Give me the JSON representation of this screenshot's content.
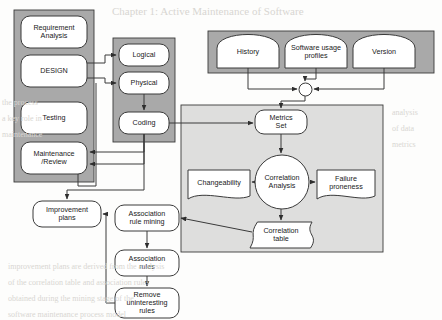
{
  "diagram": {
    "colors": {
      "panel_dark": "#a9a9a9",
      "panel_light": "#dededd",
      "node_fill": "#ffffff",
      "stroke": "#3a3a3a",
      "ghost": "#d8d6d2"
    },
    "panels": [
      {
        "name": "lifecycle-panel",
        "x": 14,
        "y": 10,
        "w": 80,
        "h": 172,
        "fill": "#a9a9a9"
      },
      {
        "name": "design-stage-panel",
        "x": 113,
        "y": 38,
        "w": 62,
        "h": 104,
        "fill": "#a9a9a9"
      },
      {
        "name": "data-sources-panel",
        "x": 208,
        "y": 31,
        "w": 226,
        "h": 42,
        "fill": "#a9a9a9"
      },
      {
        "name": "analysis-panel",
        "x": 181,
        "y": 105,
        "w": 202,
        "h": 147,
        "fill": "#dededd"
      }
    ],
    "nodes": [
      {
        "name": "requirement-analysis",
        "label": "Requirement\nAnalysis",
        "shape": "rounded",
        "x": 21,
        "y": 16,
        "w": 66,
        "h": 32,
        "font": 7.2
      },
      {
        "name": "design",
        "label": "DESIGN",
        "shape": "rounded",
        "x": 21,
        "y": 55,
        "w": 66,
        "h": 32,
        "font": 7.2
      },
      {
        "name": "testing",
        "label": "Testing",
        "shape": "rounded",
        "x": 21,
        "y": 102,
        "w": 66,
        "h": 32,
        "font": 7.2
      },
      {
        "name": "maintenance-review",
        "label": "Maintenance\n/Review",
        "shape": "rounded",
        "x": 21,
        "y": 142,
        "w": 66,
        "h": 32,
        "font": 7.2
      },
      {
        "name": "logical",
        "label": "Logical",
        "shape": "rounded",
        "x": 119,
        "y": 44,
        "w": 50,
        "h": 22,
        "font": 7.2
      },
      {
        "name": "physical",
        "label": "Physical",
        "shape": "rounded",
        "x": 119,
        "y": 72,
        "w": 50,
        "h": 22,
        "font": 7.2
      },
      {
        "name": "coding",
        "label": "Coding",
        "shape": "rounded",
        "x": 119,
        "y": 112,
        "w": 50,
        "h": 22,
        "font": 7.2
      },
      {
        "name": "history",
        "label": "History",
        "shape": "cylinder-top",
        "x": 217,
        "y": 36,
        "w": 62,
        "h": 32,
        "font": 7.2
      },
      {
        "name": "software-usage-profiles",
        "label": "Software usage\nprofiles",
        "shape": "cylinder-top",
        "x": 285,
        "y": 36,
        "w": 62,
        "h": 32,
        "font": 7.2
      },
      {
        "name": "version",
        "label": "Version",
        "shape": "cylinder-top",
        "x": 353,
        "y": 36,
        "w": 62,
        "h": 32,
        "font": 7.2
      },
      {
        "name": "junction",
        "label": "",
        "shape": "circle-junction",
        "x": 299,
        "y": 83,
        "w": 13,
        "h": 13,
        "font": 0
      },
      {
        "name": "metrics-set",
        "label": "Metrics\nSet",
        "shape": "rounded",
        "x": 255,
        "y": 110,
        "w": 52,
        "h": 24,
        "font": 7.2
      },
      {
        "name": "correlation-analysis",
        "label": "Correlation\nAnalysis",
        "shape": "circle",
        "x": 255,
        "y": 155,
        "w": 54,
        "h": 54,
        "font": 7.2
      },
      {
        "name": "changeability",
        "label": "Changeability",
        "shape": "document",
        "x": 188,
        "y": 170,
        "w": 62,
        "h": 26,
        "font": 7.2
      },
      {
        "name": "failure-proneness",
        "label": "Failure\nproneness",
        "shape": "document",
        "x": 317,
        "y": 170,
        "w": 58,
        "h": 26,
        "font": 7.2
      },
      {
        "name": "correlation-table",
        "label": "Correlation\ntable",
        "shape": "data-tape",
        "x": 250,
        "y": 222,
        "w": 62,
        "h": 26,
        "font": 7.2
      },
      {
        "name": "improvement-plans",
        "label": "Improvement\nplans",
        "shape": "rounded",
        "x": 33,
        "y": 201,
        "w": 68,
        "h": 26,
        "font": 7.2
      },
      {
        "name": "association-rule-mining",
        "label": "Association\nrule mining",
        "shape": "rounded",
        "x": 115,
        "y": 205,
        "w": 64,
        "h": 26,
        "font": 7.2
      },
      {
        "name": "association-rules",
        "label": "Association\nrules",
        "shape": "rounded",
        "x": 115,
        "y": 250,
        "w": 64,
        "h": 26,
        "font": 7.2
      },
      {
        "name": "remove-uninteresting-rules",
        "label": "Remove\nuninteresting\nrules",
        "shape": "rounded",
        "x": 115,
        "y": 288,
        "w": 64,
        "h": 30,
        "font": 7.2
      }
    ],
    "connectors": [
      {
        "name": "design-to-logical",
        "d": "M 87 63 L 105 63 L 105 55 L 116 55",
        "arrow": "end"
      },
      {
        "name": "design-to-physical",
        "d": "M 87 78 L 105 78 L 105 83 L 116 83",
        "arrow": "end"
      },
      {
        "name": "physical-to-coding",
        "d": "M 144 94 L 144 110",
        "arrow": "end"
      },
      {
        "name": "coding-to-maintenance-up",
        "d": "M 144 134 L 144 152 L 90 152",
        "arrow": "end"
      },
      {
        "name": "coding-loop-to-maintenance",
        "d": "M 144 134 L 144 164 L 90 164",
        "arrow": "end"
      },
      {
        "name": "maintenance-to-physical-left",
        "d": "M 78 160 L 78 186 L 96 186 L 96 83",
        "arrow": "none"
      },
      {
        "name": "coding-to-metrics",
        "d": "M 169 123 L 253 123",
        "arrow": "end"
      },
      {
        "name": "coding-down-to-improvement",
        "d": "M 144 134 L 144 190 L 67 190 L 67 199",
        "arrow": "end"
      },
      {
        "name": "history-to-junction",
        "d": "M 248 68 L 248 89 L 297 89",
        "arrow": "end"
      },
      {
        "name": "profiles-to-junction",
        "d": "M 316 68 L 316 79 L 305 79 L 305 81",
        "arrow": "end"
      },
      {
        "name": "version-to-junction",
        "d": "M 384 68 L 384 89 L 314 89",
        "arrow": "end"
      },
      {
        "name": "junction-to-metrics",
        "d": "M 305 96 L 305 101 L 281 101 L 281 108",
        "arrow": "end"
      },
      {
        "name": "metrics-to-correlation",
        "d": "M 281 134 L 281 153",
        "arrow": "end"
      },
      {
        "name": "correlation-to-changeability",
        "d": "M 253 182 L 252 182",
        "arrow": "end"
      },
      {
        "name": "correlation-to-failure",
        "d": "M 311 182 L 315 182",
        "arrow": "end"
      },
      {
        "name": "correlation-to-table",
        "d": "M 281 209 L 281 220",
        "arrow": "end"
      },
      {
        "name": "table-to-association-mining",
        "d": "M 252 232 L 181 218",
        "arrow": "end"
      },
      {
        "name": "mining-to-rules",
        "d": "M 147 231 L 147 248",
        "arrow": "end"
      },
      {
        "name": "rules-to-remove",
        "d": "M 147 276 L 147 286",
        "arrow": "end"
      },
      {
        "name": "remove-to-improvement",
        "d": "M 115 303 L 106 303 L 106 214 L 103 214",
        "arrow": "end"
      }
    ],
    "ghost_texts": [
      {
        "name": "ghost-header",
        "text": "Chapter 1: Active Maintenance of Software",
        "x": 112,
        "y": 5,
        "size": 11
      },
      {
        "name": "ghost-line-left-1",
        "text": "the process",
        "x": 2,
        "y": 98,
        "size": 8
      },
      {
        "name": "ghost-line-left-2",
        "text": "a key role in",
        "x": 2,
        "y": 114,
        "size": 8
      },
      {
        "name": "ghost-line-left-3",
        "text": "maintenance",
        "x": 2,
        "y": 130,
        "size": 8
      },
      {
        "name": "ghost-body-1",
        "text": "improvement plans are derived from the analysis",
        "x": 8,
        "y": 262,
        "size": 8
      },
      {
        "name": "ghost-body-2",
        "text": "of the correlation table and association rules",
        "x": 8,
        "y": 278,
        "size": 8
      },
      {
        "name": "ghost-body-3",
        "text": "obtained during the mining stage of the",
        "x": 8,
        "y": 294,
        "size": 8
      },
      {
        "name": "ghost-body-4",
        "text": "software maintenance process model",
        "x": 8,
        "y": 310,
        "size": 8
      },
      {
        "name": "ghost-right-1",
        "text": "analysis",
        "x": 392,
        "y": 108,
        "size": 8
      },
      {
        "name": "ghost-right-2",
        "text": "of data",
        "x": 392,
        "y": 124,
        "size": 8
      },
      {
        "name": "ghost-right-3",
        "text": "metrics",
        "x": 392,
        "y": 140,
        "size": 8
      }
    ]
  }
}
